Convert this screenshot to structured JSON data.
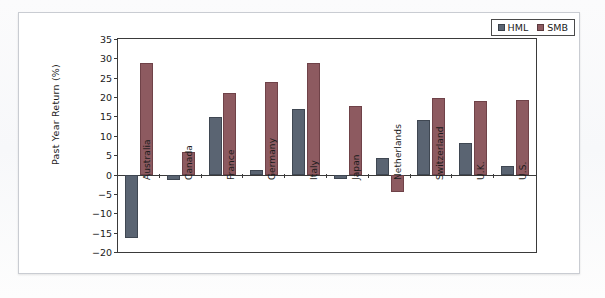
{
  "figure": {
    "card_background": "#ffffff",
    "page_background": "#f8f9fa",
    "border_color": "#c9ccd2"
  },
  "chart_data": {
    "type": "bar",
    "title": "",
    "xlabel": "",
    "ylabel": "Past Year Return (%)",
    "ylim": [
      -20,
      35
    ],
    "ytick_step": 5,
    "yticks": [
      35,
      30,
      25,
      20,
      15,
      10,
      5,
      0,
      -5,
      -10,
      -15,
      -20
    ],
    "ytick_labels": [
      "35",
      "30",
      "25",
      "20",
      "15",
      "10",
      "5",
      "0",
      "−5",
      "−10",
      "−15",
      "−20"
    ],
    "grid": false,
    "legend_position": "top-right",
    "categories": [
      "Australia",
      "Canada",
      "France",
      "Germany",
      "Italy",
      "Japan",
      "Netherlands",
      "Switzerland",
      "U.K.",
      "U.S."
    ],
    "series": [
      {
        "name": "HML",
        "color": "#5a6472",
        "values": [
          -16.5,
          -1.5,
          14.8,
          1.2,
          16.8,
          -1.2,
          4.2,
          14.2,
          8.2,
          2.3
        ]
      },
      {
        "name": "SMB",
        "color": "#8d5a60",
        "values": [
          28.9,
          5.8,
          21.0,
          23.8,
          28.8,
          17.8,
          -4.5,
          19.8,
          19.0,
          19.2
        ]
      }
    ]
  },
  "legend": {
    "items": [
      {
        "label": "HML",
        "color": "#5a6472"
      },
      {
        "label": "SMB",
        "color": "#8d5a60"
      }
    ]
  }
}
